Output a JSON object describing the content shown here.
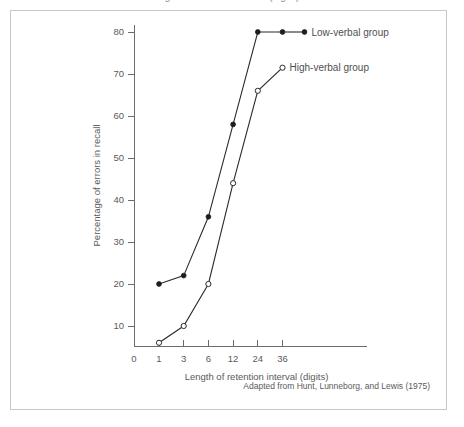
{
  "figure": {
    "top_cut_text": "Length of retention interval (digits)",
    "source_note": "Adapted from Hunt, Lunneborg, and Lewis (1975)",
    "frame_color": "#c8c8c8",
    "line_color": "#2b2b2b",
    "text_color": "#5a5a5a"
  },
  "chart_data": {
    "type": "line",
    "title": "",
    "subtitle": "",
    "xlabel": "Length of retention interval (digits)",
    "ylabel": "Percentage of errors in recall",
    "categories": [
      "1",
      "3",
      "6",
      "12",
      "24",
      "36"
    ],
    "x_tick_labels": [
      "0",
      "1",
      "3",
      "6",
      "12",
      "24",
      "36"
    ],
    "y_tick_labels": [
      "10",
      "20",
      "30",
      "40",
      "50",
      "60",
      "70",
      "80"
    ],
    "y_ticks": [
      10,
      20,
      30,
      40,
      50,
      60,
      70,
      80
    ],
    "ylim": [
      0,
      84
    ],
    "grid": false,
    "legend_position": "inline-right-of-endpoints",
    "series": [
      {
        "name": "Low-verbal group",
        "label": "Low-verbal group",
        "marker": "filled-circle",
        "values": [
          20,
          22,
          36,
          58,
          80,
          80
        ]
      },
      {
        "name": "High-verbal group",
        "label": "High-verbal group",
        "marker": "open-circle",
        "values": [
          6,
          10,
          20,
          44,
          66,
          71.5
        ]
      }
    ],
    "annotations": [
      "Adapted from Hunt, Lunneborg, and Lewis (1975)"
    ]
  }
}
